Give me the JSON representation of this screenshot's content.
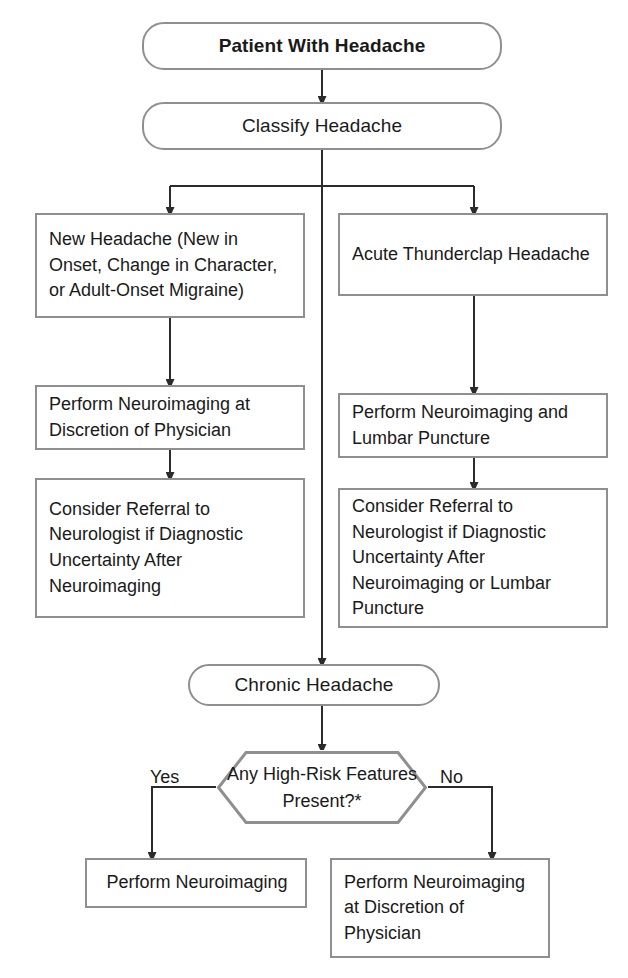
{
  "diagram": {
    "border_color": "#8f8f8f",
    "line_color": "#2b2b2b",
    "background": "#ffffff"
  },
  "nodes": {
    "start": {
      "label": "Patient With Headache",
      "shape": "terminator"
    },
    "classify": {
      "label": "Classify Headache",
      "shape": "terminator"
    },
    "new_headache": {
      "label": "New Headache (New in Onset, Change in Character, or Adult-Onset Migraine)",
      "shape": "process"
    },
    "thunderclap": {
      "label": "Acute Thunderclap Headache",
      "shape": "process"
    },
    "neuro_discretion": {
      "label": "Perform Neuroimaging at Discretion of Physician",
      "shape": "process"
    },
    "neuro_lp": {
      "label": "Perform Neuroimaging and Lumbar Puncture",
      "shape": "process"
    },
    "referral_left": {
      "label": "Consider Referral to Neurologist if Diagnostic Uncertainty After Neuroimaging",
      "shape": "process"
    },
    "referral_right": {
      "label": "Consider Referral to Neurologist if Diagnostic Uncertainty After Neuroimaging or Lumbar Puncture",
      "shape": "process"
    },
    "chronic": {
      "label": "Chronic Headache",
      "shape": "terminator"
    },
    "decision": {
      "label": "Any High-Risk Features Present?*",
      "shape": "decision"
    },
    "perform_neuro": {
      "label": "Perform Neuroimaging",
      "shape": "process"
    },
    "perform_neuro_discretion": {
      "label": "Perform Neuroimaging at Discretion of Physician",
      "shape": "process"
    }
  },
  "edge_labels": {
    "yes": "Yes",
    "no": "No"
  },
  "footnote": {
    "clipped_caption": ""
  }
}
